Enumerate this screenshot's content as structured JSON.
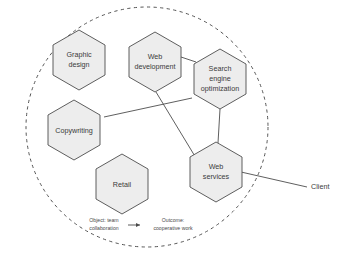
{
  "diagram": {
    "type": "hexagon-network-diagram",
    "boundary": {
      "name": "organization-boundary",
      "shape": "circle",
      "stroke_style": "dashed",
      "stroke_color": "#555555"
    },
    "colors": {
      "node_fill": "#ededed",
      "node_stroke": "#4d4d4d",
      "connector": "#4d4d4d",
      "text": "#3a3a3a",
      "caption_text": "#4a4a4a"
    },
    "nodes": [
      {
        "id": "graphic-design",
        "lines": [
          "Graphic",
          "design"
        ],
        "cx": 79,
        "cy": 60,
        "r": 30
      },
      {
        "id": "web-development",
        "lines": [
          "Web",
          "development"
        ],
        "cx": 155,
        "cy": 62,
        "r": 30
      },
      {
        "id": "search-engine-optimization",
        "lines": [
          "Search",
          "engine",
          "optimization"
        ],
        "cx": 220,
        "cy": 79,
        "r": 30
      },
      {
        "id": "copywriting",
        "lines": [
          "Copywriting"
        ],
        "cx": 74,
        "cy": 130,
        "r": 30
      },
      {
        "id": "retail",
        "lines": [
          "Retail"
        ],
        "cx": 122,
        "cy": 184,
        "r": 30
      },
      {
        "id": "web-services",
        "lines": [
          "Web",
          "services"
        ],
        "cx": 216,
        "cy": 172,
        "r": 30
      }
    ],
    "external_nodes": [
      {
        "id": "client",
        "label": "Client",
        "x": 320,
        "y": 187
      }
    ],
    "connectors": [
      {
        "from": "web-development",
        "to": "search-engine-optimization"
      },
      {
        "from": "search-engine-optimization",
        "to": "web-services"
      },
      {
        "from": "web-development",
        "to": "web-services"
      },
      {
        "from": "copywriting",
        "to": "search-engine-optimization"
      },
      {
        "from": "web-services",
        "to": "client"
      }
    ],
    "caption": {
      "object_label": "Object: team collaboration",
      "object_line_1": "Object: team",
      "object_line_2": "collaboration",
      "arrow_glyph": "→",
      "outcome_line_1": "Outcome:",
      "outcome_line_2": "cooperative work",
      "outcome_label": "Outcome: cooperative work"
    }
  }
}
